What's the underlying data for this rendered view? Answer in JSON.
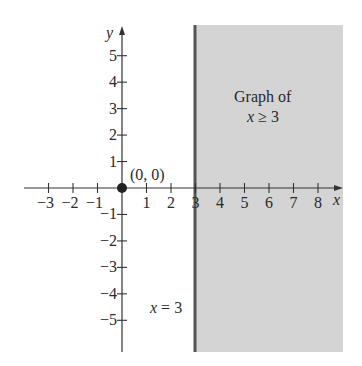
{
  "chart_data": {
    "type": "area",
    "title": "",
    "xlabel": "x",
    "ylabel": "y",
    "xlim": [
      -4,
      9
    ],
    "ylim": [
      -7,
      6.5
    ],
    "grid": false,
    "x_ticks": [
      -3,
      -2,
      -1,
      1,
      2,
      3,
      4,
      5,
      6,
      7,
      8
    ],
    "x_tick_labels": [
      "−3",
      "−2",
      "−1",
      "1",
      "2",
      "3",
      "4",
      "5",
      "6",
      "7",
      "8"
    ],
    "y_ticks": [
      5,
      4,
      3,
      2,
      1,
      -1,
      -2,
      -3,
      -4,
      -5
    ],
    "y_tick_labels": [
      "5",
      "4",
      "3",
      "2",
      "1",
      "−1",
      "−2",
      "−3",
      "−4",
      "−5"
    ],
    "boundary_line": {
      "equation": "x = 3",
      "x": 3,
      "style": "solid"
    },
    "shaded_region": {
      "inequality": "x ≥ 3",
      "x_from": 3,
      "x_to": 9,
      "color": "#d4d4d4"
    },
    "points": [
      {
        "x": 0,
        "y": 0,
        "label": "(0, 0)",
        "filled": true
      }
    ],
    "annotations": [
      {
        "text_line1": "Graph of",
        "text_line2": "x ≥ 3",
        "position": "inside shaded region, upper"
      },
      {
        "text": "x = 3",
        "position": "left of boundary line, lower"
      }
    ]
  },
  "labels": {
    "x_axis": "x",
    "y_axis": "y",
    "origin_point": "(0, 0)",
    "region_title_line1": "Graph of",
    "region_title_var": "x",
    "region_title_rest": " ≥ 3",
    "boundary_var": "x",
    "boundary_rest": " = 3"
  },
  "colors": {
    "shade": "#d4d4d4",
    "boundary": "#555555",
    "axis": "#333333",
    "text": "#2a2a2a"
  }
}
